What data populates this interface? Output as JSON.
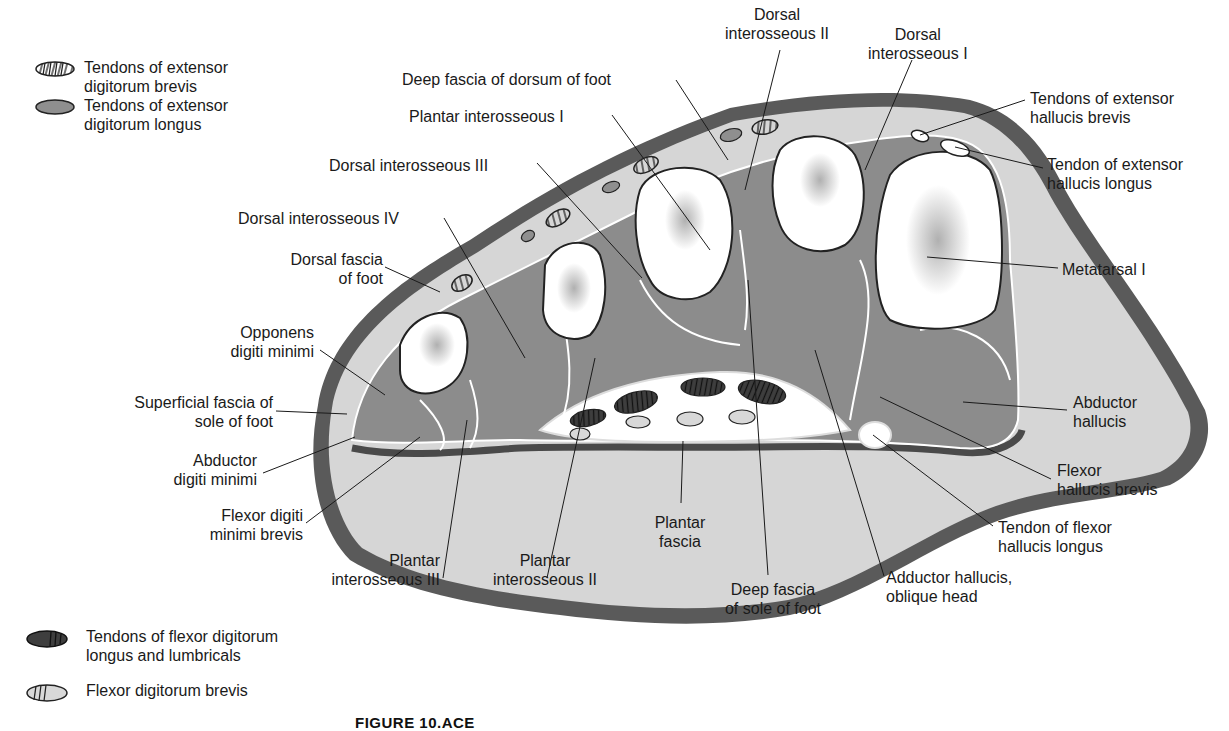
{
  "figure": {
    "caption_label": "FIGURE 10.ACE"
  },
  "legend": {
    "items": [
      {
        "icon": "striped-oval-icon",
        "line1": "Tendons of extensor",
        "line2": "digitorum brevis"
      },
      {
        "icon": "gray-oval-icon",
        "line1": "Tendons of extensor",
        "line2": "digitorum longus"
      },
      {
        "icon": "dark-striped-oval-icon",
        "line1": "Tendons of flexor digitorum",
        "line2": "longus and lumbricals"
      },
      {
        "icon": "light-striped-oval-icon",
        "line1": "Flexor digitorum brevis",
        "line2": ""
      }
    ]
  },
  "labels": {
    "dorsal_interosseous_ii": {
      "line1": "Dorsal",
      "line2": "interosseous II"
    },
    "dorsal_interosseous_i": {
      "line1": "Dorsal",
      "line2": "interosseous I"
    },
    "deep_fascia_dorsum": {
      "line1": "Deep fascia of dorsum of foot"
    },
    "plantar_interosseous_i": {
      "line1": "Plantar interosseous I"
    },
    "dorsal_interosseous_iii": {
      "line1": "Dorsal interosseous III"
    },
    "dorsal_interosseous_iv": {
      "line1": "Dorsal interosseous IV"
    },
    "dorsal_fascia": {
      "line1": "Dorsal fascia",
      "line2": "of foot"
    },
    "opponens": {
      "line1": "Opponens",
      "line2": "digiti minimi"
    },
    "superficial_fascia": {
      "line1": "Superficial fascia of",
      "line2": "sole of foot"
    },
    "abductor_digiti_minimi": {
      "line1": "Abductor",
      "line2": "digiti minimi"
    },
    "flexor_digiti_minimi_brevis": {
      "line1": "Flexor digiti",
      "line2": "minimi brevis"
    },
    "plantar_interosseous_iii": {
      "line1": "Plantar",
      "line2": "interosseous III"
    },
    "plantar_interosseous_ii": {
      "line1": "Plantar",
      "line2": "interosseous II"
    },
    "plantar_fascia": {
      "line1": "Plantar",
      "line2": "fascia"
    },
    "deep_fascia_sole": {
      "line1": "Deep fascia",
      "line2": "of sole of foot"
    },
    "adductor_hallucis": {
      "line1": "Adductor hallucis,",
      "line2": "oblique head"
    },
    "tendon_fhl": {
      "line1": "Tendon of flexor",
      "line2": "hallucis longus"
    },
    "flexor_hallucis_brevis": {
      "line1": "Flexor",
      "line2": "hallucis brevis"
    },
    "abductor_hallucis": {
      "line1": "Abductor",
      "line2": "hallucis"
    },
    "metatarsal_i": {
      "line1": "Metatarsal I"
    },
    "tendon_ehl": {
      "line1": "Tendon of extensor",
      "line2": "hallucis longus"
    },
    "tendons_ehb": {
      "line1": "Tendons of extensor",
      "line2": "hallucis brevis"
    }
  },
  "colors": {
    "skin": "#5a5a5a",
    "subcutaneous": "#d6d6d6",
    "muscle": "#8c8c8c",
    "bone": "#ffffff",
    "marrow": "#8a8a8a",
    "tendon_dark": "#3e3e3e",
    "tendon_gray": "#8f8f8f",
    "line": "#1a1a1a"
  }
}
